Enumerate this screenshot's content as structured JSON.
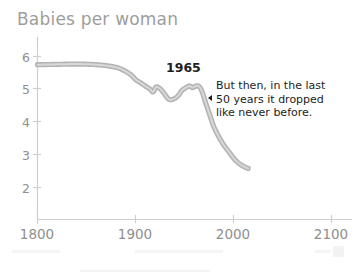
{
  "chart_data": {
    "type": "line",
    "title": "Babies per woman",
    "xlabel": "",
    "ylabel": "",
    "xlim": [
      1800,
      2120
    ],
    "ylim": [
      1.5,
      6.35
    ],
    "grid": false,
    "legend": "none",
    "xticks": [
      "1800",
      "1900",
      "2000",
      "2100"
    ],
    "xtick_values": [
      1800,
      1900,
      2000,
      2100
    ],
    "yticks": [
      "6",
      "5",
      "4",
      "3",
      "2"
    ],
    "ytick_values": [
      6,
      5,
      4,
      3,
      2
    ],
    "series": [
      {
        "name": "Babies per woman",
        "color": "#b4b4b4",
        "x": [
          1800,
          1820,
          1840,
          1860,
          1875,
          1885,
          1895,
          1900,
          1905,
          1910,
          1915,
          1918,
          1921,
          1925,
          1929,
          1933,
          1936,
          1940,
          1944,
          1947,
          1950,
          1955,
          1958,
          1962,
          1965,
          1968,
          1972,
          1976,
          1980,
          1985,
          1990,
          1995,
          2000,
          2005,
          2010,
          2015
        ],
        "y": [
          5.75,
          5.76,
          5.77,
          5.75,
          5.7,
          5.62,
          5.45,
          5.3,
          5.2,
          5.1,
          5.0,
          4.92,
          5.07,
          5.02,
          4.88,
          4.72,
          4.68,
          4.72,
          4.82,
          4.95,
          5.02,
          5.1,
          5.05,
          5.1,
          5.08,
          4.92,
          4.55,
          4.2,
          3.85,
          3.55,
          3.3,
          3.1,
          2.9,
          2.75,
          2.65,
          2.58
        ]
      }
    ],
    "annotations": [
      {
        "name": "peak-year-label",
        "text": "1965",
        "x": 1958,
        "y": 5.62,
        "bold": true
      },
      {
        "name": "decline-note",
        "marker": "left-triangle",
        "lines": [
          "But then, in the last",
          "50 years it dropped",
          "like never before."
        ]
      }
    ]
  },
  "axis": {
    "line_color": "#cfcfcf",
    "tick_color": "#cfcfcf",
    "label_color": "#8f8f8f"
  },
  "theme": {
    "background": "#ffffff",
    "title_color": "#9d9d9d",
    "line_color": "#b4b4b4",
    "line_highlight": "#d8d8d8",
    "annotation_color": "#1d1d1d"
  }
}
